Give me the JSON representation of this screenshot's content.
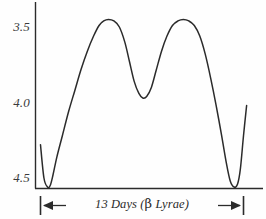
{
  "chart_data": {
    "type": "line",
    "title": "",
    "subtitle": "",
    "xlabel": "13 Days (β Lyrae)",
    "ylabel": "",
    "ylim": [
      4.6,
      3.35
    ],
    "xlim": [
      0,
      13
    ],
    "y_axis_inverted": true,
    "grid": false,
    "legend": null,
    "yticks": [
      "3.5",
      "4.0",
      "4.5"
    ],
    "ytick_values": [
      3.5,
      4.0,
      4.5
    ],
    "xticks": [],
    "annotations": [
      {
        "name": "period-span-arrow",
        "text": "13 Days (β Lyrae)",
        "from_x": 0.0,
        "to_x": 13.0,
        "style": "double-headed-arrow-with-end-bars"
      }
    ],
    "series": [
      {
        "name": "Beta Lyrae visual magnitude",
        "x": [
          0.0,
          0.22,
          0.45,
          0.62,
          0.8,
          1.05,
          1.4,
          1.8,
          2.2,
          2.6,
          3.0,
          3.4,
          3.75,
          4.05,
          4.35,
          4.7,
          5.05,
          5.4,
          5.7,
          6.0,
          6.3,
          6.55,
          6.8,
          7.1,
          7.4,
          7.75,
          8.1,
          8.45,
          8.8,
          9.15,
          9.5,
          9.85,
          10.2,
          10.55,
          10.9,
          11.25,
          11.6,
          11.9,
          12.15,
          12.4,
          12.62,
          12.8,
          13.0,
          13.2
        ],
        "y": [
          4.28,
          4.5,
          4.56,
          4.55,
          4.48,
          4.36,
          4.22,
          4.06,
          3.92,
          3.78,
          3.66,
          3.56,
          3.49,
          3.46,
          3.45,
          3.46,
          3.5,
          3.6,
          3.73,
          3.86,
          3.94,
          3.97,
          3.96,
          3.9,
          3.79,
          3.66,
          3.56,
          3.49,
          3.46,
          3.45,
          3.46,
          3.49,
          3.56,
          3.68,
          3.84,
          4.02,
          4.22,
          4.4,
          4.52,
          4.56,
          4.54,
          4.44,
          4.22,
          4.02
        ],
        "color": "#2b2b2b"
      }
    ]
  },
  "axes": {
    "y_axis_label_top": "3.5",
    "y_axis_label_mid": "4.0",
    "y_axis_label_bottom": "4.5"
  },
  "caption": {
    "prefix": "13 Days (",
    "beta": "β",
    "suffix": " Lyrae)",
    "full": "13 Days (β Lyrae)"
  },
  "colors": {
    "ink": "#2b2b2b",
    "curve": "#2b2b2b",
    "background": "#fefefe"
  }
}
